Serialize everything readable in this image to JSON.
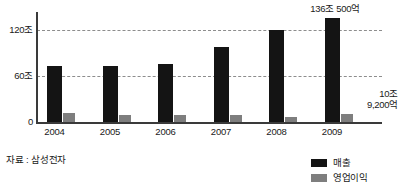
{
  "chart_data": {
    "type": "bar",
    "title": "",
    "xlabel": "",
    "ylabel": "",
    "categories": [
      "2004",
      "2005",
      "2006",
      "2007",
      "2008",
      "2009"
    ],
    "series": [
      {
        "name": "매출",
        "color": "#141414",
        "unit": "조",
        "values": [
          73,
          73,
          76,
          98,
          120,
          136.05
        ]
      },
      {
        "name": "영업이익",
        "color": "#7e7e7e",
        "unit": "조",
        "values": [
          12,
          9,
          9,
          9,
          6,
          10.92
        ]
      }
    ],
    "ylim": [
      0,
      145
    ],
    "yticks": [
      0,
      60,
      120
    ],
    "ytick_labels": [
      "0",
      "60조",
      "120조"
    ],
    "grid": true,
    "gridlines_at": [
      60,
      120
    ],
    "legend_position": "bottom-right",
    "annotations": [
      {
        "id": "revenue-2009",
        "text": "136조 500억",
        "target_category": "2009",
        "target_series": "매출"
      },
      {
        "id": "profit-2009",
        "text": "10조\n9,200억",
        "target_category": "2009",
        "target_series": "영업이익"
      }
    ]
  },
  "axis": {
    "y_labels": [
      {
        "text": "120조",
        "value": 120
      },
      {
        "text": "60조",
        "value": 60
      },
      {
        "text": "0",
        "value": 0
      }
    ],
    "x_labels": [
      "2004",
      "2005",
      "2006",
      "2007",
      "2008",
      "2009"
    ]
  },
  "annotations": {
    "top": "136조 500억",
    "right": "10조\n9,200억"
  },
  "legend": {
    "items": [
      {
        "label": "매출",
        "color": "#141414"
      },
      {
        "label": "영업이익",
        "color": "#7e7e7e"
      }
    ]
  },
  "source": {
    "text": "자료 : 삼성전자"
  },
  "colors": {
    "revenue": "#141414",
    "profit": "#7e7e7e",
    "axis": "#3a3a3a",
    "grid": "#8d8d8d",
    "text": "#1a1a1a",
    "background": "#ffffff"
  }
}
